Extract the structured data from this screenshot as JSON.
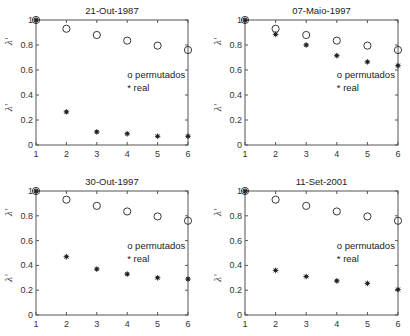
{
  "chart_data": [
    {
      "type": "scatter",
      "title": "21-Out-1987",
      "xlabel": "",
      "ylabel": "λ_i / λ_1",
      "x": [
        1,
        2,
        3,
        4,
        5,
        6
      ],
      "xticks": [
        "1",
        "2",
        "3",
        "4",
        "5",
        "6"
      ],
      "yticks": [
        "0",
        "0.2",
        "0.4",
        "0.6",
        "0.8",
        "1"
      ],
      "xlim": [
        1,
        6
      ],
      "ylim": [
        0,
        1
      ],
      "grid": false,
      "legend": [
        "o permutados",
        "* real"
      ],
      "legend_position": "inside-right",
      "series": [
        {
          "name": "permutados",
          "marker": "o",
          "values": [
            1.0,
            0.93,
            0.88,
            0.835,
            0.795,
            0.76
          ]
        },
        {
          "name": "real",
          "marker": "*",
          "values": [
            1.0,
            0.265,
            0.105,
            0.09,
            0.07,
            0.07
          ]
        }
      ]
    },
    {
      "type": "scatter",
      "title": "07-Maio-1997",
      "xlabel": "",
      "ylabel": "λ_i / λ_1",
      "x": [
        1,
        2,
        3,
        4,
        5,
        6
      ],
      "xticks": [
        "1",
        "2",
        "3",
        "4",
        "5",
        "6"
      ],
      "yticks": [
        "0",
        "0.2",
        "0.4",
        "0.6",
        "0.8",
        "1"
      ],
      "xlim": [
        1,
        6
      ],
      "ylim": [
        0,
        1
      ],
      "grid": false,
      "legend": [
        "o permutados",
        "* real"
      ],
      "legend_position": "inside-right",
      "series": [
        {
          "name": "permutados",
          "marker": "o",
          "values": [
            1.0,
            0.93,
            0.88,
            0.835,
            0.795,
            0.76
          ]
        },
        {
          "name": "real",
          "marker": "*",
          "values": [
            1.0,
            0.885,
            0.8,
            0.715,
            0.665,
            0.635
          ]
        }
      ]
    },
    {
      "type": "scatter",
      "title": "30-Out-1997",
      "xlabel": "",
      "ylabel": "λ_i / λ_1",
      "x": [
        1,
        2,
        3,
        4,
        5,
        6
      ],
      "xticks": [
        "1",
        "2",
        "3",
        "4",
        "5",
        "6"
      ],
      "yticks": [
        "0",
        "0.2",
        "0.4",
        "0.6",
        "0.8",
        "1"
      ],
      "xlim": [
        1,
        6
      ],
      "ylim": [
        0,
        1
      ],
      "grid": false,
      "legend": [
        "o permutados",
        "* real"
      ],
      "legend_position": "inside-right",
      "series": [
        {
          "name": "permutados",
          "marker": "o",
          "values": [
            1.0,
            0.93,
            0.88,
            0.835,
            0.795,
            0.76
          ]
        },
        {
          "name": "real",
          "marker": "*",
          "values": [
            1.0,
            0.47,
            0.37,
            0.33,
            0.3,
            0.29
          ]
        }
      ]
    },
    {
      "type": "scatter",
      "title": "11-Set-2001",
      "xlabel": "",
      "ylabel": "λ_i / λ_1",
      "x": [
        1,
        2,
        3,
        4,
        5,
        6
      ],
      "xticks": [
        "1",
        "2",
        "3",
        "4",
        "5",
        "6"
      ],
      "yticks": [
        "0",
        "0.2",
        "0.4",
        "0.6",
        "0.8",
        "1"
      ],
      "xlim": [
        1,
        6
      ],
      "ylim": [
        0,
        1
      ],
      "grid": false,
      "legend": [
        "o permutados",
        "* real"
      ],
      "legend_position": "inside-right",
      "series": [
        {
          "name": "permutados",
          "marker": "o",
          "values": [
            1.0,
            0.93,
            0.88,
            0.835,
            0.795,
            0.76
          ]
        },
        {
          "name": "real",
          "marker": "*",
          "values": [
            1.0,
            0.36,
            0.31,
            0.275,
            0.255,
            0.205
          ]
        }
      ]
    }
  ],
  "ylabel_top": "λ'",
  "ylabel_bottom": "λ'",
  "colors": {
    "axis": "#555555",
    "marker": "#222222",
    "background": "#ffffff"
  }
}
